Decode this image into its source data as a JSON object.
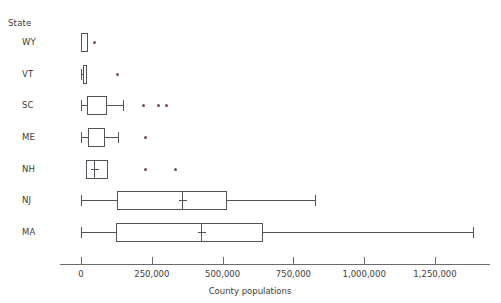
{
  "chart_data": {
    "type": "box",
    "title": "",
    "xlabel": "County populations",
    "ylabel": "State",
    "ylabel_header": "State",
    "grid": false,
    "legend": "none",
    "xlim": [
      -75000,
      1445000
    ],
    "xticks": [
      0,
      250000,
      500000,
      750000,
      1000000,
      1250000
    ],
    "xticklabels": [
      "0",
      "250,000",
      "500,000",
      "750,000",
      "1,000,000",
      "1,250,000"
    ],
    "categories": [
      "WY",
      "VT",
      "SC",
      "ME",
      "NH",
      "NJ",
      "MA"
    ],
    "box_color": "#54535c",
    "outlier_color": "#7b4a5e",
    "axis_color": "#6b6b6b",
    "text_color": "#3c3c3c",
    "boxes": [
      {
        "label": "WY",
        "whisker_low": 0,
        "q1": 0,
        "median": null,
        "mean": null,
        "q3": 25000,
        "whisker_high": 25000,
        "outliers": [
          46000
        ]
      },
      {
        "label": "VT",
        "whisker_low": 0,
        "q1": 7000,
        "median": null,
        "mean": null,
        "q3": 21000,
        "whisker_high": 21000,
        "outliers": [
          128000
        ]
      },
      {
        "label": "SC",
        "whisker_low": 0,
        "q1": 21000,
        "median": null,
        "mean": null,
        "q3": 92000,
        "whisker_high": 148000,
        "outliers": [
          222000,
          275000,
          303000
        ]
      },
      {
        "label": "ME",
        "whisker_low": 0,
        "q1": 25000,
        "median": null,
        "mean": null,
        "q3": 85000,
        "whisker_high": 131000,
        "outliers": [
          226000
        ]
      },
      {
        "label": "NH",
        "whisker_low": 18000,
        "q1": 18000,
        "median": 46000,
        "mean": 46000,
        "q3": 95000,
        "whisker_high": 95000,
        "outliers": [
          226000,
          332000
        ]
      },
      {
        "label": "NJ",
        "whisker_low": 0,
        "q1": 127000,
        "median": 357000,
        "mean": 357000,
        "q3": 515000,
        "whisker_high": 825000,
        "outliers": []
      },
      {
        "label": "MA",
        "whisker_low": 0,
        "q1": 124000,
        "median": 424000,
        "mean": 424000,
        "q3": 642000,
        "whisker_high": 1385000,
        "outliers": []
      }
    ]
  }
}
